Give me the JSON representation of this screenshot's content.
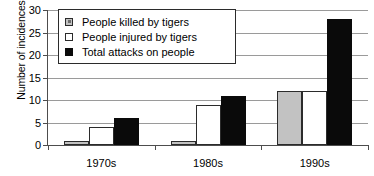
{
  "chart_data": {
    "type": "bar",
    "title": "",
    "subtitle": "",
    "xlabel": "",
    "ylabel": "Number of incidences",
    "categories": [
      "1970s",
      "1980s",
      "1990s"
    ],
    "series": [
      {
        "name": "People killed by tigers",
        "key": "killed",
        "color": "#c2c2c2",
        "values": [
          1,
          1,
          12
        ]
      },
      {
        "name": "People injured by tigers",
        "key": "injured",
        "color": "#ffffff",
        "values": [
          4,
          9,
          12
        ]
      },
      {
        "name": "Total attacks on people",
        "key": "total",
        "color": "#0a0a0a",
        "values": [
          6,
          11,
          28
        ]
      }
    ],
    "ylim": [
      0,
      30
    ],
    "yticks": [
      0,
      5,
      10,
      15,
      20,
      25,
      30
    ],
    "ytick_labels": [
      "0",
      "5",
      "10",
      "15",
      "20",
      "25",
      "30"
    ],
    "grid": true,
    "grid_axis": "y",
    "legend_position": "upper-left-inside",
    "legend_border_color": "#2b2b2b",
    "axis_color": "#4d4d4d",
    "gridline_color": "#9a9a9a",
    "background": "#ffffff"
  }
}
